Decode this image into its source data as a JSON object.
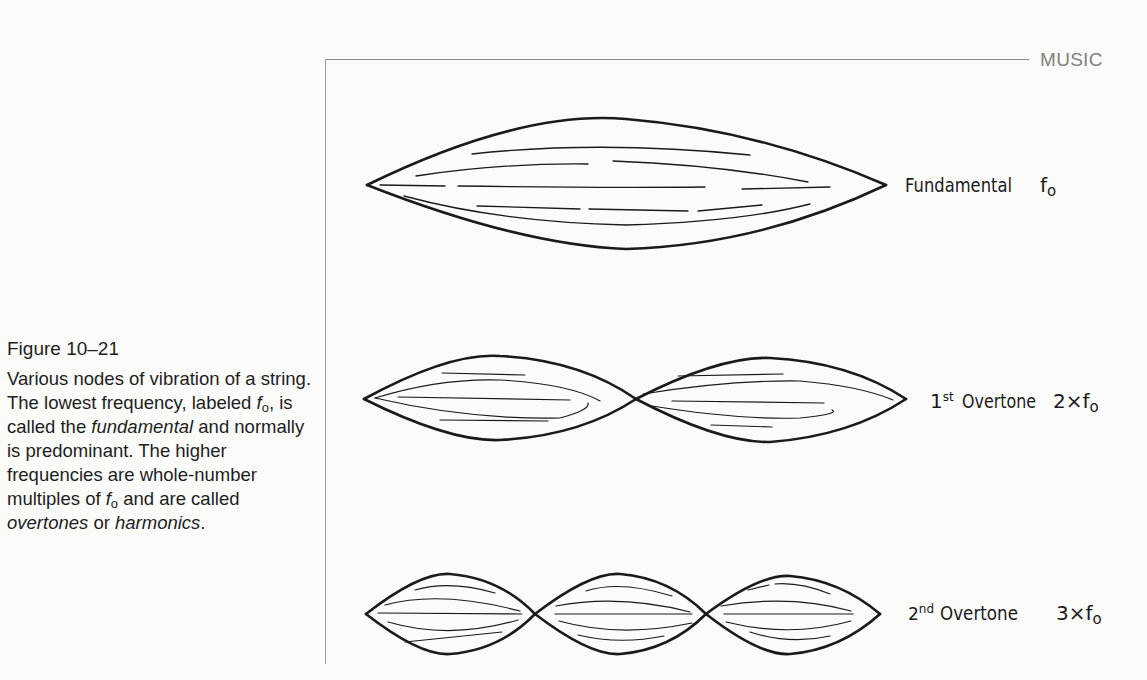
{
  "page": {
    "running_head": "MUSIC"
  },
  "caption": {
    "figure_number": "Figure 10–21",
    "parts": [
      "Various nodes of vibration of a string. The lowest frequency, labeled ",
      "f",
      "o",
      ", is called the ",
      "fundamental",
      " and normally is predominant. The higher frequencies are whole-number multiples of ",
      "f",
      "o",
      " and are called ",
      "overtones",
      " or ",
      "harmonics",
      "."
    ]
  },
  "figure": {
    "modes": [
      {
        "name": "Fundamental",
        "multiple": "f",
        "multiple_sub": "o",
        "loops": 1
      },
      {
        "name_sup": "st",
        "name_num": "1",
        "name": "Overtone",
        "multiple": "2×f",
        "multiple_sub": "o",
        "loops": 2
      },
      {
        "name_sup": "nd",
        "name_num": "2",
        "name": "Overtone",
        "multiple": "3×f",
        "multiple_sub": "o",
        "loops": 3
      }
    ]
  }
}
